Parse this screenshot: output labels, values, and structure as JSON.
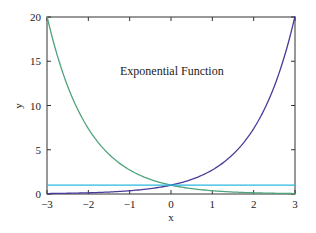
{
  "chart_data": {
    "type": "line",
    "title": "",
    "annotation": "Exponential Function",
    "xlabel": "x",
    "ylabel": "y",
    "xlim": [
      -3,
      3
    ],
    "ylim": [
      0,
      20
    ],
    "xticks": [
      -3,
      -2,
      -1,
      0,
      1,
      2,
      3
    ],
    "xtick_labels": [
      "−3",
      "−2",
      "−1",
      "0",
      "1",
      "2",
      "3"
    ],
    "yticks": [
      0,
      5,
      10,
      15,
      20
    ],
    "ytick_labels": [
      "0",
      "5",
      "10",
      "15",
      "20"
    ],
    "grid": false,
    "legend": null,
    "x": [
      -3,
      -2.5,
      -2,
      -1.5,
      -1,
      -0.5,
      0,
      0.5,
      1,
      1.5,
      2,
      2.5,
      3
    ],
    "series": [
      {
        "name": "exp(-x)",
        "color": "#4fa37a",
        "values": [
          20.09,
          12.18,
          7.39,
          4.48,
          2.72,
          1.65,
          1.0,
          0.61,
          0.37,
          0.22,
          0.14,
          0.08,
          0.05
        ]
      },
      {
        "name": "exp(x)",
        "color": "#4a3a9a",
        "values": [
          0.05,
          0.08,
          0.14,
          0.22,
          0.37,
          0.61,
          1.0,
          1.65,
          2.72,
          4.48,
          7.39,
          12.18,
          20.09
        ]
      },
      {
        "name": "1",
        "color": "#2ab8e0",
        "values": [
          1,
          1,
          1,
          1,
          1,
          1,
          1,
          1,
          1,
          1,
          1,
          1,
          1
        ]
      }
    ]
  },
  "plot": {
    "left": 47,
    "top": 17,
    "right": 295,
    "bottom": 194,
    "axis_color": "#333333"
  }
}
